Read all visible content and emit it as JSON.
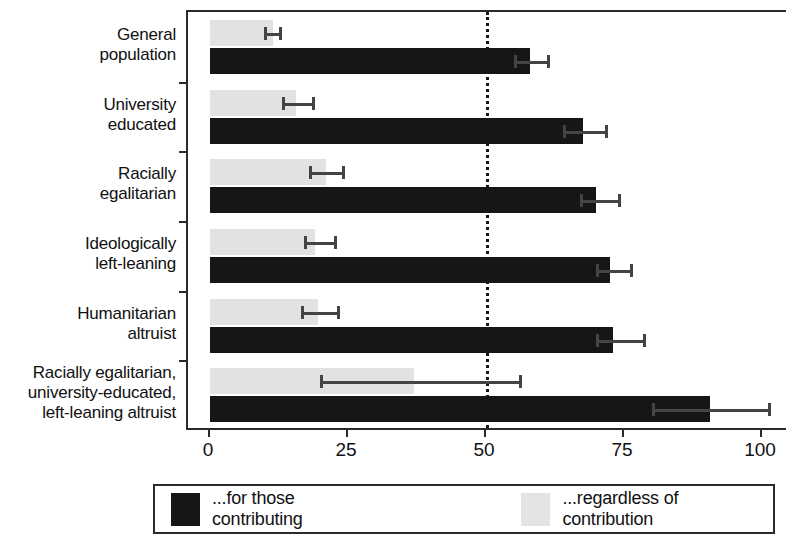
{
  "chart_data": {
    "type": "bar",
    "orientation": "horizontal",
    "title": "",
    "xlabel": "",
    "ylabel": "",
    "xlim": [
      0,
      100
    ],
    "xticks": [
      0,
      25,
      50,
      75,
      100
    ],
    "xtick_labels": [
      "0",
      "25",
      "50",
      "75",
      "100"
    ],
    "grid": false,
    "reference_line": {
      "value": 50,
      "style": "dotted"
    },
    "legend_position": "bottom",
    "categories": [
      "General population",
      "University educated",
      "Racially egalitarian",
      "Ideologically left-leaning",
      "Humanitarian altruist",
      "Racially egalitarian, university-educated, left-leaning altruist"
    ],
    "category_label_lines": [
      [
        "General",
        "population"
      ],
      [
        "University",
        "educated"
      ],
      [
        "Racially",
        "egalitarian"
      ],
      [
        "Ideologically",
        "left-leaning"
      ],
      [
        "Humanitarian",
        "altruist"
      ],
      [
        "Racially egalitarian,",
        "university-educated,",
        "left-leaning altruist"
      ]
    ],
    "series": [
      {
        "name": "...for those contributing",
        "color": "#161616",
        "values": [
          58,
          67.5,
          70,
          72.5,
          73,
          90.5
        ],
        "error_low": [
          55,
          64,
          67,
          70,
          70,
          80
        ],
        "error_high": [
          61,
          71.5,
          74,
          76,
          78.5,
          101
        ]
      },
      {
        "name": "...regardless of contribution",
        "color": "#e2e2e2",
        "values": [
          11.5,
          15.5,
          21,
          19,
          19.5,
          37
        ],
        "error_low": [
          9.8,
          13,
          18,
          17,
          16.5,
          20
        ],
        "error_high": [
          12.5,
          18.5,
          24,
          22.5,
          23,
          56
        ]
      }
    ]
  },
  "legend": {
    "items": [
      {
        "label": "...for those contributing",
        "color": "#161616"
      },
      {
        "label": "...regardless of contribution",
        "color": "#e4e4e4"
      }
    ]
  }
}
